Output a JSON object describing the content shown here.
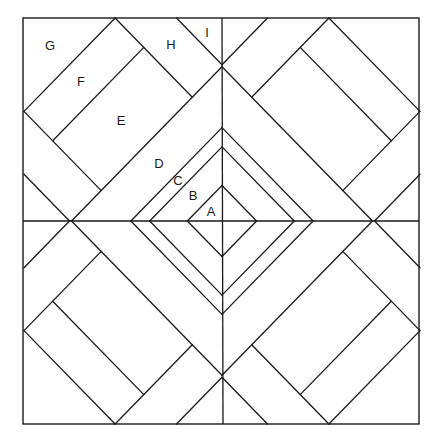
{
  "diagram": {
    "type": "quilt-block",
    "stroke_color": "#1a1a1a",
    "background": "#ffffff",
    "stroke_width": 1.3,
    "outer_square": {
      "x": 23,
      "y": 18,
      "width": 396,
      "height": 406
    },
    "center": {
      "x": 222,
      "y": 221
    },
    "scale": {
      "x": 0.99,
      "y": 1.015
    },
    "center_lines": {
      "vertical": {
        "x1": 222,
        "y1": 18,
        "x2": 223,
        "y2": 424
      },
      "horizontal": {
        "x1": 23,
        "y1": 221,
        "x2": 419,
        "y2": 221
      }
    },
    "quadrant_segments": [
      {
        "name": "g-diagonal",
        "p1": [
          -108,
          -200
        ],
        "p2": [
          -200,
          -108
        ]
      },
      {
        "name": "rect-upper-side",
        "p1": [
          -108,
          -200
        ],
        "p2": [
          -30,
          -122
        ]
      },
      {
        "name": "rect-lower-side",
        "p1": [
          -200,
          -108
        ],
        "p2": [
          -122,
          -30
        ]
      },
      {
        "name": "f-e-divider",
        "p1": [
          -79,
          -171
        ],
        "p2": [
          -171,
          -79
        ]
      },
      {
        "name": "i-corner-line",
        "p1": [
          -46,
          -200
        ],
        "p2": [
          0,
          -154
        ]
      },
      {
        "name": "side-corner-line",
        "p1": [
          -200,
          -46
        ],
        "p2": [
          -154,
          0
        ]
      },
      {
        "name": "big-diamond-edge",
        "p1": [
          0,
          -152
        ],
        "p2": [
          -152,
          0
        ]
      },
      {
        "name": "c-d-diamond-edge",
        "p1": [
          0,
          -92
        ],
        "p2": [
          -92,
          0
        ]
      },
      {
        "name": "b-c-diamond-edge",
        "p1": [
          0,
          -73
        ],
        "p2": [
          -73,
          0
        ]
      },
      {
        "name": "a-diamond-edge",
        "p1": [
          0,
          -35
        ],
        "p2": [
          -35,
          0
        ]
      }
    ],
    "labels": [
      {
        "text": "G",
        "x": 50,
        "y": 45
      },
      {
        "text": "H",
        "x": 171,
        "y": 44
      },
      {
        "text": "I",
        "x": 207,
        "y": 32
      },
      {
        "text": "F",
        "x": 81,
        "y": 81
      },
      {
        "text": "E",
        "x": 121,
        "y": 120
      },
      {
        "text": "D",
        "x": 159,
        "y": 163
      },
      {
        "text": "C",
        "x": 178,
        "y": 180
      },
      {
        "text": "B",
        "x": 193,
        "y": 195
      },
      {
        "text": "A",
        "x": 211,
        "y": 211
      }
    ]
  }
}
